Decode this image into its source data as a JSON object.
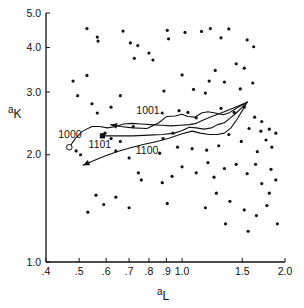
{
  "chart_data": {
    "type": "scatter",
    "title": "",
    "xlabel": "a_L",
    "ylabel": "a_K",
    "xlabel_base": "a",
    "xlabel_sub": "L",
    "ylabel_base": "a",
    "ylabel_sub": "K",
    "xscale": "log",
    "yscale": "log",
    "xlim": [
      0.4,
      2.0
    ],
    "ylim": [
      1.0,
      5.0
    ],
    "grid": false,
    "legend": "none",
    "xticks": [
      0.4,
      0.5,
      0.6,
      0.7,
      0.8,
      0.9,
      1.0,
      1.5,
      2.0
    ],
    "xticklabels": [
      ".4",
      ".5",
      ".6",
      ".7",
      ".8",
      ".9",
      "1.0",
      "1.5",
      "2.0"
    ],
    "yticks": [
      1.0,
      2.0,
      3.0,
      4.0,
      5.0
    ],
    "yticklabels": [
      "1.0",
      "2.0",
      "3.0",
      "4.0",
      "5.0"
    ],
    "scatter": {
      "name": "background-observations",
      "marker": "dot",
      "color": "#111111",
      "size": 1.6,
      "points": [
        [
          0.527,
          4.52
        ],
        [
          0.565,
          4.28
        ],
        [
          0.568,
          4.17
        ],
        [
          0.672,
          4.45
        ],
        [
          0.706,
          4.12
        ],
        [
          0.742,
          4.05
        ],
        [
          0.905,
          4.47
        ],
        [
          0.913,
          4.23
        ],
        [
          1.02,
          4.41
        ],
        [
          1.14,
          4.44
        ],
        [
          1.21,
          4.52
        ],
        [
          1.3,
          4.26
        ],
        [
          1.37,
          4.51
        ],
        [
          1.55,
          4.2
        ],
        [
          1.62,
          4.02
        ],
        [
          0.8,
          3.86
        ],
        [
          0.725,
          3.73
        ],
        [
          0.822,
          3.69
        ],
        [
          0.48,
          3.22
        ],
        [
          0.527,
          3.34
        ],
        [
          0.495,
          2.93
        ],
        [
          0.545,
          2.78
        ],
        [
          0.565,
          2.62
        ],
        [
          0.66,
          2.93
        ],
        [
          0.885,
          3.02
        ],
        [
          1.0,
          3.35
        ],
        [
          1.08,
          3.05
        ],
        [
          1.17,
          2.98
        ],
        [
          1.2,
          3.22
        ],
        [
          1.33,
          3.2
        ],
        [
          1.48,
          3.06
        ],
        [
          1.61,
          3.18
        ],
        [
          1.25,
          3.45
        ],
        [
          1.3,
          2.7
        ],
        [
          1.42,
          2.63
        ],
        [
          1.52,
          2.72
        ],
        [
          0.62,
          2.72
        ],
        [
          0.72,
          2.4
        ],
        [
          0.875,
          2.62
        ],
        [
          0.98,
          2.66
        ],
        [
          1.04,
          2.63
        ],
        [
          1.1,
          2.54
        ],
        [
          1.57,
          2.37
        ],
        [
          1.7,
          2.33
        ],
        [
          1.76,
          2.2
        ],
        [
          1.83,
          2.1
        ],
        [
          1.66,
          2.04
        ],
        [
          1.49,
          2.18
        ],
        [
          1.37,
          2.28
        ],
        [
          1.28,
          2.12
        ],
        [
          1.18,
          2.06
        ],
        [
          1.07,
          2.08
        ],
        [
          0.97,
          2.1
        ],
        [
          0.86,
          2.02
        ],
        [
          0.7,
          1.96
        ],
        [
          0.745,
          1.78
        ],
        [
          0.76,
          1.7
        ],
        [
          0.875,
          1.67
        ],
        [
          0.935,
          1.74
        ],
        [
          1.0,
          1.85
        ],
        [
          1.1,
          1.78
        ],
        [
          1.19,
          1.9
        ],
        [
          1.24,
          1.73
        ],
        [
          1.33,
          1.83
        ],
        [
          1.44,
          1.88
        ],
        [
          1.55,
          1.77
        ],
        [
          1.64,
          1.88
        ],
        [
          1.71,
          1.66
        ],
        [
          1.8,
          1.56
        ],
        [
          1.82,
          1.82
        ],
        [
          1.88,
          1.7
        ],
        [
          0.56,
          1.54
        ],
        [
          0.59,
          1.45
        ],
        [
          0.64,
          1.52
        ],
        [
          0.7,
          1.42
        ],
        [
          0.53,
          1.38
        ],
        [
          0.905,
          1.46
        ],
        [
          1.17,
          1.42
        ],
        [
          1.26,
          1.56
        ],
        [
          1.38,
          1.48
        ],
        [
          1.52,
          1.4
        ],
        [
          1.65,
          1.35
        ],
        [
          1.77,
          1.44
        ],
        [
          1.34,
          1.28
        ],
        [
          1.56,
          1.22
        ],
        [
          1.9,
          1.28
        ],
        [
          0.49,
          2.05
        ],
        [
          0.505,
          2.0
        ],
        [
          0.62,
          2.22
        ],
        [
          0.66,
          2.18
        ],
        [
          0.88,
          2.22
        ],
        [
          0.94,
          2.3
        ],
        [
          1.63,
          2.55
        ],
        [
          1.71,
          2.48
        ],
        [
          1.8,
          2.36
        ],
        [
          1.88,
          2.3
        ],
        [
          1.44,
          3.6
        ],
        [
          1.52,
          3.5
        ],
        [
          0.595,
          2.3
        ],
        [
          0.64,
          2.05
        ]
      ]
    },
    "trajectories": [
      {
        "label": "1000",
        "label_x": 0.47,
        "label_y": 2.28,
        "start_marker": "open-circle",
        "start": [
          0.468,
          2.1
        ],
        "color": "#111111",
        "points": [
          [
            0.468,
            2.1
          ],
          [
            0.487,
            2.22
          ],
          [
            0.512,
            2.33
          ],
          [
            0.545,
            2.4
          ],
          [
            0.575,
            2.4
          ],
          [
            0.605,
            2.38
          ],
          [
            0.64,
            2.4
          ],
          [
            0.675,
            2.44
          ],
          [
            0.715,
            2.45
          ],
          [
            0.76,
            2.44
          ],
          [
            0.81,
            2.43
          ],
          [
            0.87,
            2.42
          ],
          [
            0.93,
            2.41
          ],
          [
            0.99,
            2.42
          ],
          [
            1.05,
            2.43
          ],
          [
            1.1,
            2.45
          ],
          [
            1.15,
            2.5
          ],
          [
            1.22,
            2.56
          ],
          [
            1.3,
            2.62
          ],
          [
            1.38,
            2.68
          ],
          [
            1.46,
            2.74
          ],
          [
            1.55,
            2.81
          ]
        ]
      },
      {
        "label": "1001",
        "label_x": 0.795,
        "label_y": 2.66,
        "start_marker": "arrow",
        "start": [
          0.618,
          2.43
        ],
        "color": "#111111",
        "points": [
          [
            0.618,
            2.43
          ],
          [
            0.66,
            2.4
          ],
          [
            0.72,
            2.38
          ],
          [
            0.79,
            2.37
          ],
          [
            0.855,
            2.46
          ],
          [
            0.9,
            2.56
          ],
          [
            0.955,
            2.57
          ],
          [
            1.0,
            2.6
          ],
          [
            1.04,
            2.56
          ],
          [
            1.09,
            2.55
          ],
          [
            1.14,
            2.62
          ],
          [
            1.19,
            2.64
          ],
          [
            1.25,
            2.62
          ],
          [
            1.32,
            2.59
          ],
          [
            1.38,
            2.63
          ],
          [
            1.44,
            2.7
          ],
          [
            1.5,
            2.76
          ],
          [
            1.55,
            2.81
          ]
        ]
      },
      {
        "label": "1101",
        "label_x": 0.575,
        "label_y": 2.14,
        "start_marker": "filled-square",
        "start": [
          0.585,
          2.26
        ],
        "color": "#111111",
        "points": [
          [
            0.585,
            2.26
          ],
          [
            0.65,
            2.26
          ],
          [
            0.72,
            2.26
          ],
          [
            0.8,
            2.27
          ],
          [
            0.875,
            2.28
          ],
          [
            0.95,
            2.3
          ],
          [
            1.0,
            2.34
          ],
          [
            1.05,
            2.39
          ],
          [
            1.1,
            2.38
          ],
          [
            1.16,
            2.36
          ],
          [
            1.22,
            2.38
          ],
          [
            1.27,
            2.43
          ],
          [
            1.33,
            2.46
          ],
          [
            1.38,
            2.53
          ],
          [
            1.44,
            2.62
          ],
          [
            1.5,
            2.72
          ],
          [
            1.55,
            2.81
          ]
        ]
      },
      {
        "label": "1100",
        "label_x": 0.79,
        "label_y": 2.05,
        "start_marker": "arrow",
        "start": [
          0.513,
          1.87
        ],
        "color": "#111111",
        "points": [
          [
            0.513,
            1.87
          ],
          [
            0.555,
            1.93
          ],
          [
            0.6,
            1.99
          ],
          [
            0.655,
            2.05
          ],
          [
            0.715,
            2.1
          ],
          [
            0.775,
            2.14
          ],
          [
            0.845,
            2.18
          ],
          [
            0.92,
            2.23
          ],
          [
            1.0,
            2.29
          ],
          [
            1.07,
            2.33
          ],
          [
            1.13,
            2.3
          ],
          [
            1.2,
            2.28
          ],
          [
            1.27,
            2.28
          ],
          [
            1.33,
            2.3
          ],
          [
            1.39,
            2.38
          ],
          [
            1.45,
            2.52
          ],
          [
            1.5,
            2.66
          ],
          [
            1.55,
            2.81
          ]
        ]
      }
    ]
  },
  "axes": {
    "x_title": "a",
    "x_subscript": "L",
    "y_title": "a",
    "y_subscript": "K"
  }
}
